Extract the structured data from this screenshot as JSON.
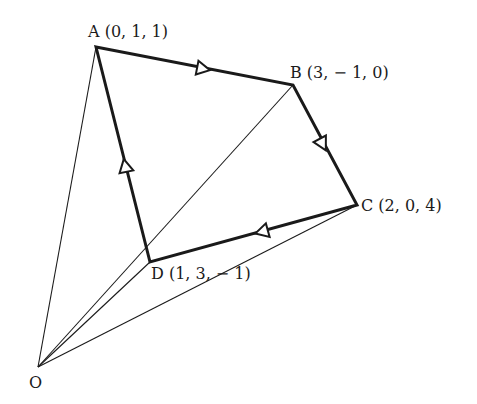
{
  "diagram": {
    "type": "vector-quadrilateral",
    "points": [
      {
        "id": "O",
        "label": "O",
        "coords": null,
        "px": [
          38,
          367
        ]
      },
      {
        "id": "A",
        "label": "A (0, 1, 1)",
        "coords": [
          0,
          1,
          1
        ],
        "px": [
          96,
          47
        ]
      },
      {
        "id": "B",
        "label": "B (3, − 1, 0)",
        "coords": [
          3,
          -1,
          0
        ],
        "px": [
          293,
          85
        ]
      },
      {
        "id": "C",
        "label": "C (2, 0, 4)",
        "coords": [
          2,
          0,
          4
        ],
        "px": [
          357,
          205
        ]
      },
      {
        "id": "D",
        "label": "D (1, 3, − 1)",
        "coords": [
          1,
          3,
          -1
        ],
        "px": [
          150,
          262
        ]
      }
    ],
    "directed_edges": [
      {
        "from": "A",
        "to": "B"
      },
      {
        "from": "B",
        "to": "C"
      },
      {
        "from": "C",
        "to": "D"
      },
      {
        "from": "D",
        "to": "A"
      }
    ],
    "rays_from_origin": [
      "A",
      "B",
      "C",
      "D"
    ],
    "colors": {
      "line": "#1a1a1a",
      "background": "#ffffff"
    }
  },
  "labels": {
    "A": "A (0, 1, 1)",
    "B": "B (3, − 1, 0)",
    "C": "C (2, 0, 4)",
    "D": "D (1, 3, − 1)",
    "O": "O"
  }
}
